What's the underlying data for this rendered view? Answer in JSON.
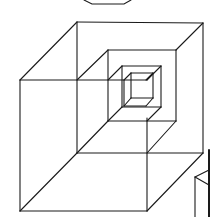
{
  "figure": {
    "title": "Nested wireframe cubes",
    "stroke_color": "#1a1a1a",
    "background": "#ffffff"
  },
  "shapes": {
    "top_partial_hexagon": {
      "points": [
        [
          84,
          0
        ],
        [
          92,
          4
        ],
        [
          124,
          4
        ],
        [
          131,
          0
        ]
      ]
    },
    "cubes": [
      {
        "name": "outer-cube",
        "back": [
          [
            77,
            22
          ],
          [
            203,
            23
          ],
          [
            203,
            153
          ],
          [
            77,
            153
          ]
        ],
        "front": [
          [
            20,
            80
          ],
          [
            147,
            80
          ],
          [
            147,
            211
          ],
          [
            20,
            211
          ]
        ],
        "visible_edges": [
          [
            [
              77,
              22
            ],
            [
              203,
              23
            ]
          ],
          [
            [
              203,
              23
            ],
            [
              203,
              153
            ]
          ],
          [
            [
              77,
              22
            ],
            [
              77,
              153
            ]
          ],
          [
            [
              77,
              153
            ],
            [
              203,
              153
            ]
          ],
          [
            [
              20,
              80
            ],
            [
              147,
              80
            ]
          ],
          [
            [
              20,
              80
            ],
            [
              20,
              211
            ]
          ],
          [
            [
              20,
              211
            ],
            [
              147,
              211
            ]
          ],
          [
            [
              147,
              118
            ],
            [
              147,
              211
            ]
          ],
          [
            [
              77,
              22
            ],
            [
              20,
              80
            ]
          ],
          [
            [
              77,
              153
            ],
            [
              20,
              211
            ]
          ],
          [
            [
              203,
              153
            ],
            [
              147,
              211
            ]
          ],
          [
            [
              203,
              23
            ],
            [
              176,
              50
            ]
          ]
        ]
      },
      {
        "name": "second-cube",
        "back": [
          [
            108,
            50
          ],
          [
            176,
            50
          ],
          [
            176,
            121
          ],
          [
            108,
            121
          ]
        ],
        "front": [
          [
            77,
            80
          ],
          [
            147,
            80
          ],
          [
            147,
            153
          ],
          [
            77,
            153
          ]
        ],
        "visible_edges": [
          [
            [
              108,
              50
            ],
            [
              176,
              50
            ]
          ],
          [
            [
              176,
              50
            ],
            [
              176,
              121
            ]
          ],
          [
            [
              108,
              50
            ],
            [
              108,
              121
            ]
          ],
          [
            [
              108,
              121
            ],
            [
              176,
              121
            ]
          ],
          [
            [
              108,
              50
            ],
            [
              77,
              80
            ]
          ],
          [
            [
              108,
              121
            ],
            [
              77,
              153
            ]
          ],
          [
            [
              176,
              121
            ],
            [
              147,
              153
            ]
          ]
        ]
      },
      {
        "name": "third-cube",
        "back": [
          [
            122,
            66
          ],
          [
            161,
            66
          ],
          [
            161,
            107
          ],
          [
            122,
            107
          ]
        ],
        "front": [
          [
            108,
            80
          ],
          [
            147,
            80
          ],
          [
            147,
            121
          ],
          [
            108,
            121
          ]
        ],
        "visible_edges": [
          [
            [
              122,
              66
            ],
            [
              161,
              66
            ]
          ],
          [
            [
              161,
              66
            ],
            [
              161,
              107
            ]
          ],
          [
            [
              122,
              66
            ],
            [
              122,
              107
            ]
          ],
          [
            [
              122,
              107
            ],
            [
              161,
              107
            ]
          ],
          [
            [
              122,
              66
            ],
            [
              108,
              80
            ]
          ],
          [
            [
              122,
              107
            ],
            [
              108,
              121
            ]
          ],
          [
            [
              161,
              107
            ],
            [
              147,
              121
            ]
          ],
          [
            [
              161,
              66
            ],
            [
              147,
              80
            ]
          ]
        ]
      },
      {
        "name": "inner-cube",
        "back": [
          [
            131,
            73
          ],
          [
            153,
            73
          ],
          [
            153,
            98
          ],
          [
            131,
            98
          ]
        ],
        "front": [
          [
            124,
            80
          ],
          [
            146,
            80
          ],
          [
            146,
            106
          ],
          [
            124,
            106
          ]
        ],
        "visible_edges": [
          [
            [
              131,
              73
            ],
            [
              153,
              73
            ]
          ],
          [
            [
              153,
              73
            ],
            [
              153,
              98
            ]
          ],
          [
            [
              131,
              73
            ],
            [
              131,
              98
            ]
          ],
          [
            [
              131,
              98
            ],
            [
              153,
              98
            ]
          ],
          [
            [
              124,
              80
            ],
            [
              124,
              106
            ]
          ],
          [
            [
              124,
              106
            ],
            [
              146,
              106
            ]
          ],
          [
            [
              131,
              73
            ],
            [
              124,
              80
            ]
          ],
          [
            [
              131,
              98
            ],
            [
              124,
              106
            ]
          ],
          [
            [
              153,
              98
            ],
            [
              146,
              106
            ]
          ],
          [
            [
              153,
              73
            ],
            [
              146,
              80
            ]
          ]
        ]
      }
    ],
    "right_partial_object": {
      "edges": [
        [
          [
            209,
            150
          ],
          [
            209,
            217
          ]
        ],
        [
          [
            195,
            177
          ],
          [
            195,
            217
          ]
        ],
        [
          [
            195,
            177
          ],
          [
            209,
            170
          ]
        ],
        [
          [
            195,
            177
          ],
          [
            209,
            185
          ]
        ]
      ]
    }
  }
}
